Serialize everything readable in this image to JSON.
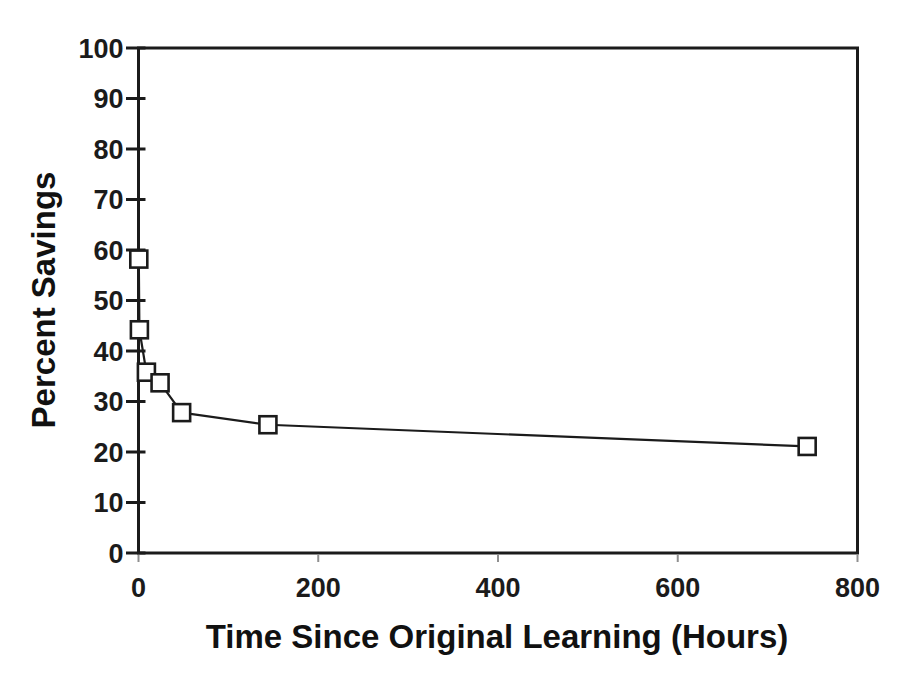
{
  "figure": {
    "background_color": "#ffffff",
    "ink_color": "#1b1b1b"
  },
  "chart_data": {
    "type": "line",
    "title": "",
    "xlabel": "Time Since Original Learning (Hours)",
    "ylabel": "Percent Savings",
    "xlim": [
      0,
      800
    ],
    "ylim": [
      0,
      100
    ],
    "x_ticks": [
      0,
      200,
      400,
      600,
      800
    ],
    "y_ticks": [
      0,
      10,
      20,
      30,
      40,
      50,
      60,
      70,
      80,
      90,
      100
    ],
    "grid": false,
    "legend_position": "none",
    "marker": "open-square",
    "marker_fill": "#ffffff",
    "line_color": "#1b1b1b",
    "frame_color": "#1b1b1b",
    "series": [
      {
        "name": "savings-curve",
        "x": [
          0.33,
          1,
          8.8,
          24,
          48,
          144,
          744
        ],
        "y": [
          58.2,
          44.2,
          35.8,
          33.7,
          27.8,
          25.4,
          21.1
        ]
      }
    ]
  }
}
